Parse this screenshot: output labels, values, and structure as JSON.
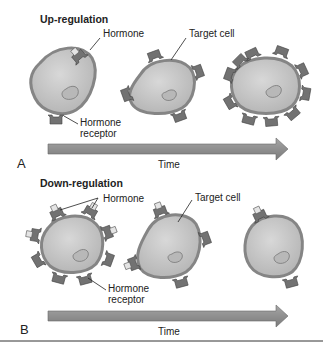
{
  "panels": [
    {
      "letter": "A",
      "title": "Up-regulation",
      "labels": {
        "hormone": "Hormone",
        "target_cell": "Target cell",
        "receptor_line1": "Hormone",
        "receptor_line2": "receptor"
      },
      "axis_label": "Time",
      "receptor_counts": [
        2,
        5,
        10
      ]
    },
    {
      "letter": "B",
      "title": "Down-regulation",
      "labels": {
        "hormone": "Hormone",
        "target_cell": "Target cell",
        "receptor_line1": "Hormone",
        "receptor_line2": "receptor"
      },
      "axis_label": "Time",
      "receptor_counts": [
        10,
        5,
        2
      ]
    }
  ],
  "colors": {
    "cell_fill": "#c4c4c4",
    "membrane": "#8a8a8a",
    "receptor": "#6e6e6e",
    "arrow": "#8c8c8c",
    "hormone": "#e0e0e0"
  }
}
